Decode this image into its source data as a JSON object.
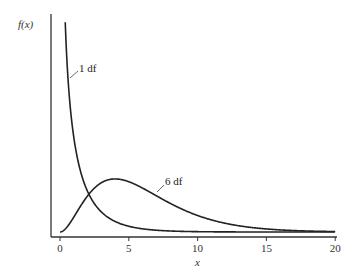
{
  "chart_data": {
    "type": "line",
    "title": "",
    "xlabel": "x",
    "ylabel": "f(x)",
    "xlim": [
      0,
      20
    ],
    "x_ticks": [
      0,
      5,
      10,
      15,
      20
    ],
    "x_tick_labels": [
      "0",
      "5",
      "10",
      "15",
      "20"
    ],
    "y_ticks": [],
    "grid": false,
    "legend": "none (inline labels)",
    "series": [
      {
        "name": "1 df",
        "df": 1,
        "x": [
          0.4,
          0.5,
          0.75,
          1,
          1.5,
          2,
          3,
          4,
          5,
          6,
          8,
          10,
          15,
          20
        ],
        "values": [
          0.517,
          0.439,
          0.323,
          0.242,
          0.154,
          0.104,
          0.051,
          0.027,
          0.015,
          0.008,
          0.003,
          0.001,
          0.0001,
          0.0
        ]
      },
      {
        "name": "6 df",
        "df": 6,
        "x": [
          0,
          1,
          2,
          3,
          4,
          5,
          6,
          7,
          8,
          10,
          12,
          15,
          20
        ],
        "values": [
          0.0,
          0.038,
          0.092,
          0.126,
          0.135,
          0.128,
          0.112,
          0.094,
          0.073,
          0.042,
          0.022,
          0.008,
          0.001
        ]
      }
    ],
    "annotations": [
      {
        "text": "1 df",
        "series": "1 df"
      },
      {
        "text": "6 df",
        "series": "6 df"
      }
    ]
  }
}
